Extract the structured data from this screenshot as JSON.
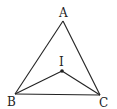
{
  "diagram": {
    "type": "geometry-triangle",
    "stroke_color": "#222222",
    "background": "#ffffff",
    "points": {
      "A": {
        "label": "A",
        "x": 63,
        "y": 21
      },
      "B": {
        "label": "B",
        "x": 15,
        "y": 94
      },
      "C": {
        "label": "C",
        "x": 100,
        "y": 95
      },
      "I": {
        "label": "I",
        "x": 62,
        "y": 71
      }
    },
    "segments": [
      [
        "A",
        "B"
      ],
      [
        "B",
        "C"
      ],
      [
        "C",
        "A"
      ],
      [
        "I",
        "B"
      ],
      [
        "I",
        "C"
      ]
    ]
  }
}
